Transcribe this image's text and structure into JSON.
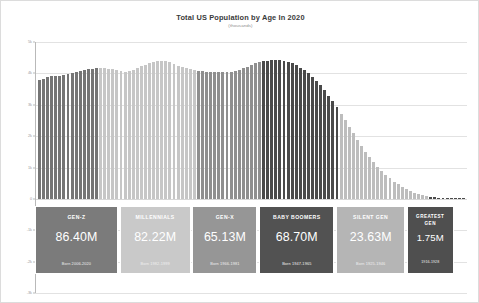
{
  "chart": {
    "title": "Total US Population by Age In 2020",
    "subtitle": "(thousands)"
  },
  "chart_data": {
    "type": "bar",
    "title": "Total US Population by Age In 2020",
    "subtitle": "(thousands)",
    "xlabel": "",
    "ylabel": "thousands",
    "ylim": [
      -3000,
      5000
    ],
    "grid": true,
    "legend_position": "below-chart-as-generation-cards",
    "y_ticks": [
      {
        "value": 5000,
        "label": "5k"
      },
      {
        "value": 4000,
        "label": "4k"
      },
      {
        "value": 3000,
        "label": "3k"
      },
      {
        "value": 2000,
        "label": "2k"
      },
      {
        "value": 1000,
        "label": "1k"
      },
      {
        "value": 0,
        "label": "0"
      },
      {
        "value": -1000,
        "label": "-1k"
      },
      {
        "value": -2000,
        "label": "-2k"
      },
      {
        "value": -3000,
        "label": "-3k"
      }
    ],
    "categories": [
      "0",
      "1",
      "2",
      "3",
      "4",
      "5",
      "6",
      "7",
      "8",
      "9",
      "10",
      "11",
      "12",
      "13",
      "14",
      "15",
      "16",
      "17",
      "18",
      "19",
      "20",
      "21",
      "22",
      "23",
      "24",
      "25",
      "26",
      "27",
      "28",
      "29",
      "30",
      "31",
      "32",
      "33",
      "34",
      "35",
      "36",
      "37",
      "38",
      "39",
      "40",
      "41",
      "42",
      "43",
      "44",
      "45",
      "46",
      "47",
      "48",
      "49",
      "50",
      "51",
      "52",
      "53",
      "54",
      "55",
      "56",
      "57",
      "58",
      "59",
      "60",
      "61",
      "62",
      "63",
      "64",
      "65",
      "66",
      "67",
      "68",
      "69",
      "70",
      "71",
      "72",
      "73",
      "74",
      "75",
      "76",
      "77",
      "78",
      "79",
      "80",
      "81",
      "82",
      "83",
      "84",
      "85",
      "86",
      "87",
      "88",
      "89",
      "90",
      "91",
      "92",
      "93",
      "94",
      "95",
      "96",
      "97",
      "98",
      "99",
      "100",
      "101",
      "102",
      "103",
      "104"
    ],
    "values": [
      3783,
      3829,
      3870,
      3901,
      3915,
      3931,
      3958,
      3990,
      4020,
      4052,
      4085,
      4110,
      4135,
      4150,
      4160,
      4165,
      4160,
      4150,
      4130,
      4100,
      4070,
      4060,
      4075,
      4110,
      4160,
      4220,
      4280,
      4330,
      4370,
      4400,
      4405,
      4390,
      4350,
      4300,
      4250,
      4200,
      4160,
      4130,
      4110,
      4090,
      4075,
      4060,
      4050,
      4040,
      4035,
      4035,
      4040,
      4055,
      4080,
      4115,
      4160,
      4215,
      4270,
      4320,
      4360,
      4390,
      4410,
      4425,
      4430,
      4425,
      4405,
      4370,
      4320,
      4255,
      4180,
      4100,
      4010,
      3900,
      3770,
      3620,
      3460,
      3290,
      3110,
      2920,
      2720,
      2510,
      2300,
      2090,
      1880,
      1680,
      1490,
      1320,
      1160,
      1010,
      880,
      760,
      650,
      550,
      460,
      380,
      310,
      250,
      196,
      152,
      116,
      87,
      64,
      46,
      32,
      22,
      14,
      9,
      5,
      3,
      1
    ],
    "series_segments": [
      {
        "name": "Gen-Z",
        "start_index": 0,
        "end_index": 14,
        "color": "#757575"
      },
      {
        "name": "Millennials",
        "start_index": 15,
        "end_index": 38,
        "color": "#c6c6c6"
      },
      {
        "name": "Gen-X",
        "start_index": 39,
        "end_index": 54,
        "color": "#8f8f8f"
      },
      {
        "name": "Baby Boomers",
        "start_index": 55,
        "end_index": 73,
        "color": "#4a4a4a"
      },
      {
        "name": "Silent Gen",
        "start_index": 74,
        "end_index": 95,
        "color": "#bdbdbd"
      },
      {
        "name": "Greatest Gen",
        "start_index": 96,
        "end_index": 104,
        "color": "#4a4a4a"
      }
    ]
  },
  "generations": [
    {
      "name": "GEN-Z",
      "value": "86.40M",
      "born": "Born 2006-2020",
      "color": "#7b7b7b",
      "left_pct": 0.0,
      "width_pct": 19.2
    },
    {
      "name": "MILLENNIALS",
      "value": "82.22M",
      "born": "Born 1982-1999",
      "color": "#c9c9c9",
      "left_pct": 19.6,
      "width_pct": 16.4
    },
    {
      "name": "GEN-X",
      "value": "65.13M",
      "born": "Born 1966-1981",
      "color": "#969696",
      "left_pct": 36.4,
      "width_pct": 15.1
    },
    {
      "name": "BABY BOOMERS",
      "value": "68.70M",
      "born": "Born 1947-1965",
      "color": "#525252",
      "left_pct": 51.9,
      "width_pct": 17.4
    },
    {
      "name": "SILENT GEN",
      "value": "23.63M",
      "born": "Born 1925-1946",
      "color": "#b5b5b5",
      "left_pct": 69.7,
      "width_pct": 16.0
    },
    {
      "name": "GREATEST\nGEN",
      "value": "1.75M",
      "born": "1916-1928",
      "color": "#4f4f4f",
      "left_pct": 86.1,
      "width_pct": 10.8,
      "small": true
    }
  ]
}
